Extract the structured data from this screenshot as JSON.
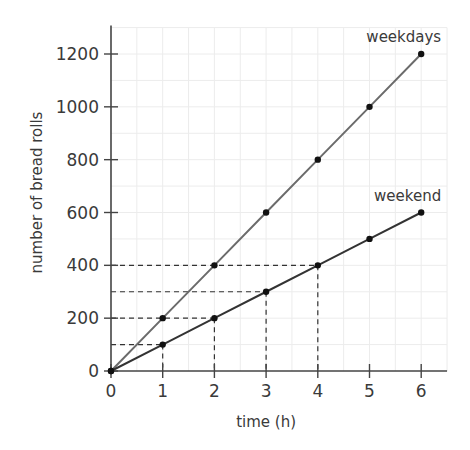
{
  "chart_data": {
    "type": "line",
    "title": "",
    "xlabel": "time (h)",
    "ylabel": "number of bread rolls",
    "x": [
      0,
      1,
      2,
      3,
      4,
      5,
      6
    ],
    "x_ticks": [
      "0",
      "1",
      "2",
      "3",
      "4",
      "5",
      "6"
    ],
    "y_ticks": [
      "0",
      "200",
      "400",
      "600",
      "800",
      "1000",
      "1200"
    ],
    "xlim": [
      0,
      6.5
    ],
    "ylim": [
      0,
      1300
    ],
    "grid": true,
    "legend": "inline labels at line ends",
    "series": [
      {
        "name": "weekdays",
        "values": [
          0,
          200,
          400,
          600,
          800,
          1000,
          1200
        ],
        "color": "#6b6b6b"
      },
      {
        "name": "weekend",
        "values": [
          0,
          100,
          200,
          300,
          400,
          500,
          600
        ],
        "color": "#333333"
      }
    ],
    "annotations": [
      {
        "type": "dashed-guide",
        "x": 1,
        "y": 100
      },
      {
        "type": "dashed-guide",
        "x": 2,
        "y": 200
      },
      {
        "type": "dashed-guide",
        "x": 3,
        "y": 300
      },
      {
        "type": "dashed-guide",
        "x": 4,
        "y": 400
      }
    ]
  }
}
